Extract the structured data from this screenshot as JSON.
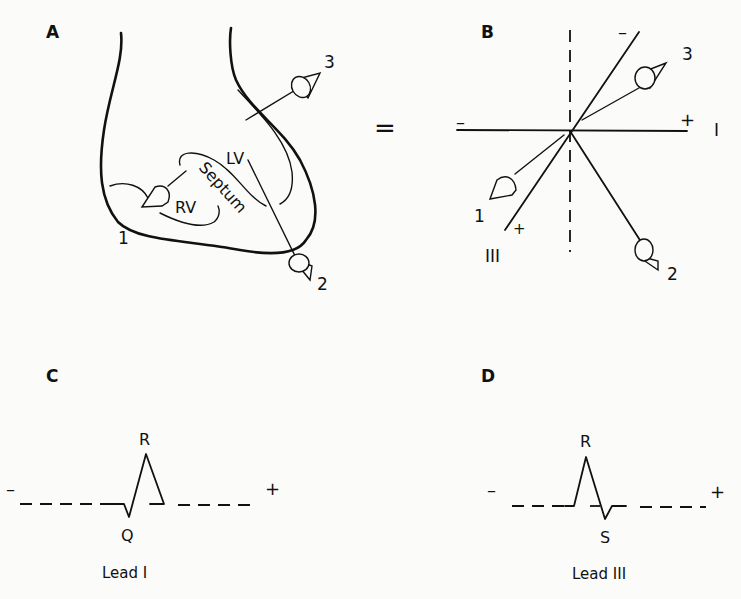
{
  "panels": {
    "A": {
      "label": "A",
      "structures": {
        "lv": "LV",
        "rv": "RV",
        "septum": "Septum"
      },
      "electrodes": [
        "1",
        "2",
        "3"
      ]
    },
    "equals": "=",
    "B": {
      "label": "B",
      "electrodes": [
        "1",
        "2",
        "3"
      ],
      "axes": {
        "lead_I": {
          "name": "I",
          "neg": "–",
          "pos": "+"
        },
        "lead_III": {
          "name": "III",
          "neg": "–",
          "pos": "+"
        }
      }
    },
    "C": {
      "label": "C",
      "waves": {
        "r": "R",
        "q": "Q"
      },
      "neg": "–",
      "pos": "+",
      "caption": "Lead I"
    },
    "D": {
      "label": "D",
      "waves": {
        "r": "R",
        "s": "S"
      },
      "neg": "–",
      "pos": "+",
      "caption": "Lead III"
    }
  },
  "colors": {
    "ink": "#111111",
    "paper": "#fbfbfa"
  }
}
